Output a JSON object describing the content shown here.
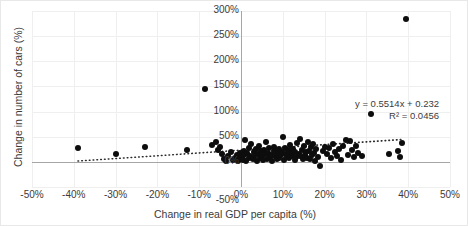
{
  "chart_data": {
    "type": "scatter",
    "title": "",
    "xlabel": "Change in real GDP per capita (%)",
    "ylabel": "Change in number of cars (%)",
    "xlim": [
      -50,
      50
    ],
    "ylim": [
      -50,
      300
    ],
    "xticks": [
      "-50%",
      "-40%",
      "-30%",
      "-20%",
      "-10%",
      "0%",
      "10%",
      "20%",
      "30%",
      "40%",
      "50%"
    ],
    "xtick_values": [
      -50,
      -40,
      -30,
      -20,
      -10,
      0,
      10,
      20,
      30,
      40,
      50
    ],
    "yticks": [
      "-50%",
      "0%",
      "50%",
      "100%",
      "150%",
      "200%",
      "250%",
      "300%"
    ],
    "ytick_values": [
      -50,
      0,
      50,
      100,
      150,
      200,
      250,
      300
    ],
    "grid": true,
    "legend": false,
    "marker_color": "#0d0d0d",
    "gridline_color": "#efefef",
    "axis_color": "#a6a6a6",
    "annotations": {
      "equation": "y = 0.5514x + 0.232",
      "r_squared": "R² = 0.0456"
    },
    "trendline": {
      "style": "dotted",
      "slope": 0.5514,
      "intercept": 23.2,
      "x_start": -39,
      "x_end": 38.5
    },
    "points": [
      [
        -39.0,
        27.0
      ],
      [
        -30.0,
        16.0
      ],
      [
        -23.0,
        30.0
      ],
      [
        -13.0,
        24.0
      ],
      [
        -8.5,
        145.0
      ],
      [
        -7.0,
        34.0
      ],
      [
        -6.0,
        40.0
      ],
      [
        -5.5,
        24.0
      ],
      [
        -5.0,
        30.0
      ],
      [
        -4.5,
        16.0
      ],
      [
        -4.0,
        6.0
      ],
      [
        -3.5,
        2.0
      ],
      [
        -3.0,
        11.0
      ],
      [
        -2.5,
        20.0
      ],
      [
        -2.0,
        3.0
      ],
      [
        -1.5,
        8.0
      ],
      [
        -1.0,
        14.0
      ],
      [
        -0.8,
        1.0
      ],
      [
        -0.5,
        6.0
      ],
      [
        -0.3,
        18.0
      ],
      [
        0.2,
        9.0
      ],
      [
        0.4,
        4.0
      ],
      [
        0.6,
        22.0
      ],
      [
        0.8,
        13.0
      ],
      [
        1.0,
        44.0
      ],
      [
        1.2,
        2.0
      ],
      [
        1.5,
        17.0
      ],
      [
        1.8,
        7.0
      ],
      [
        2.0,
        28.0
      ],
      [
        2.2,
        12.0
      ],
      [
        2.5,
        35.0
      ],
      [
        2.8,
        5.0
      ],
      [
        3.0,
        19.0
      ],
      [
        3.2,
        10.0
      ],
      [
        3.5,
        26.0
      ],
      [
        3.8,
        1.5
      ],
      [
        4.0,
        15.0
      ],
      [
        4.2,
        31.0
      ],
      [
        4.5,
        8.0
      ],
      [
        4.8,
        21.0
      ],
      [
        5.0,
        12.0
      ],
      [
        5.2,
        3.0
      ],
      [
        5.5,
        24.0
      ],
      [
        5.8,
        16.0
      ],
      [
        6.0,
        39.0
      ],
      [
        6.2,
        6.0
      ],
      [
        6.5,
        18.0
      ],
      [
        6.8,
        27.0
      ],
      [
        7.0,
        9.0
      ],
      [
        7.2,
        14.0
      ],
      [
        7.5,
        2.0
      ],
      [
        7.8,
        22.0
      ],
      [
        8.0,
        30.0
      ],
      [
        8.2,
        11.0
      ],
      [
        8.5,
        5.0
      ],
      [
        8.8,
        17.0
      ],
      [
        9.0,
        25.0
      ],
      [
        9.2,
        8.0
      ],
      [
        9.5,
        13.0
      ],
      [
        9.8,
        20.0
      ],
      [
        10.0,
        49.0
      ],
      [
        10.2,
        4.0
      ],
      [
        10.5,
        28.0
      ],
      [
        10.8,
        15.0
      ],
      [
        11.0,
        10.0
      ],
      [
        11.2,
        23.0
      ],
      [
        11.5,
        7.0
      ],
      [
        11.8,
        33.0
      ],
      [
        12.0,
        18.0
      ],
      [
        12.2,
        12.0
      ],
      [
        12.5,
        26.0
      ],
      [
        12.8,
        3.5
      ],
      [
        13.0,
        20.0
      ],
      [
        13.2,
        9.0
      ],
      [
        13.5,
        37.0
      ],
      [
        13.8,
        16.0
      ],
      [
        14.0,
        45.0
      ],
      [
        14.2,
        11.0
      ],
      [
        14.5,
        24.0
      ],
      [
        14.8,
        6.0
      ],
      [
        15.0,
        31.0
      ],
      [
        15.2,
        14.0
      ],
      [
        15.5,
        19.0
      ],
      [
        15.8,
        8.0
      ],
      [
        16.0,
        40.0
      ],
      [
        16.2,
        22.0
      ],
      [
        16.5,
        5.0
      ],
      [
        16.8,
        29.0
      ],
      [
        17.0,
        13.0
      ],
      [
        17.2,
        35.0
      ],
      [
        17.5,
        17.0
      ],
      [
        17.8,
        2.0
      ],
      [
        18.0,
        25.0
      ],
      [
        18.5,
        10.0
      ],
      [
        19.0,
        -8.0
      ],
      [
        19.5,
        21.0
      ],
      [
        20.0,
        30.0
      ],
      [
        20.5,
        15.0
      ],
      [
        21.0,
        27.0
      ],
      [
        21.5,
        7.0
      ],
      [
        22.0,
        36.0
      ],
      [
        22.5,
        19.0
      ],
      [
        23.0,
        12.0
      ],
      [
        23.5,
        26.0
      ],
      [
        24.0,
        4.0
      ],
      [
        24.5,
        32.0
      ],
      [
        25.0,
        44.0
      ],
      [
        25.5,
        14.0
      ],
      [
        26.0,
        41.0
      ],
      [
        26.5,
        23.0
      ],
      [
        27.0,
        9.0
      ],
      [
        27.5,
        31.0
      ],
      [
        28.0,
        17.0
      ],
      [
        29.0,
        11.0
      ],
      [
        31.0,
        95.0
      ],
      [
        35.5,
        16.0
      ],
      [
        37.5,
        21.0
      ],
      [
        38.5,
        38.0
      ],
      [
        38.0,
        9.0
      ],
      [
        39.5,
        285.0
      ]
    ]
  }
}
